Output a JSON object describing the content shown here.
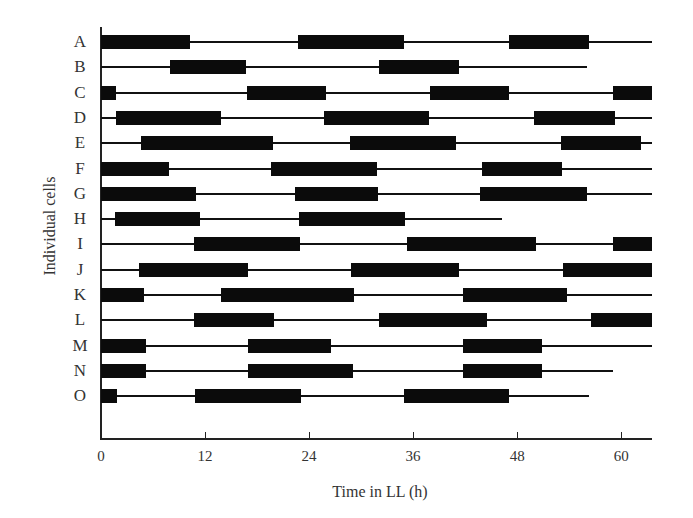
{
  "chart_data": {
    "type": "bar",
    "subtype": "horizontal-interval-timeline",
    "title": "",
    "xlabel": "Time in LL (h)",
    "ylabel": "Individual cells",
    "xlim": [
      0,
      63.6
    ],
    "xticks": [
      0,
      12,
      24,
      36,
      48,
      60
    ],
    "grid": false,
    "legend": null,
    "categories": [
      "A",
      "B",
      "C",
      "D",
      "E",
      "F",
      "G",
      "H",
      "I",
      "J",
      "K",
      "L",
      "M",
      "N",
      "O"
    ],
    "series": [
      {
        "name": "A",
        "trace": [
          0,
          63.6
        ],
        "active": [
          [
            0,
            10.3
          ],
          [
            22.7,
            35.0
          ],
          [
            47.1,
            56.3
          ]
        ]
      },
      {
        "name": "B",
        "trace": [
          0,
          56.1
        ],
        "active": [
          [
            8.0,
            16.7
          ],
          [
            32.1,
            41.3
          ]
        ]
      },
      {
        "name": "C",
        "trace": [
          0,
          63.6
        ],
        "active": [
          [
            0,
            1.7
          ],
          [
            16.8,
            26.0
          ],
          [
            38.0,
            47.1
          ],
          [
            59.1,
            63.6
          ]
        ]
      },
      {
        "name": "D",
        "trace": [
          0,
          63.6
        ],
        "active": [
          [
            1.7,
            13.8
          ],
          [
            25.7,
            37.8
          ],
          [
            49.9,
            59.3
          ]
        ]
      },
      {
        "name": "E",
        "trace": [
          0,
          63.6
        ],
        "active": [
          [
            4.6,
            19.8
          ],
          [
            28.7,
            41.0
          ],
          [
            53.0,
            62.3
          ]
        ]
      },
      {
        "name": "F",
        "trace": [
          0,
          63.6
        ],
        "active": [
          [
            0,
            7.8
          ],
          [
            19.6,
            31.8
          ],
          [
            43.9,
            53.2
          ]
        ]
      },
      {
        "name": "G",
        "trace": [
          0,
          63.6
        ],
        "active": [
          [
            0,
            11.0
          ],
          [
            22.4,
            32.0
          ],
          [
            43.7,
            56.1
          ]
        ]
      },
      {
        "name": "H",
        "trace": [
          0,
          46.2
        ],
        "active": [
          [
            1.6,
            11.4
          ],
          [
            22.8,
            35.1
          ]
        ]
      },
      {
        "name": "I",
        "trace": [
          0,
          63.6
        ],
        "active": [
          [
            10.7,
            23.0
          ],
          [
            35.3,
            50.2
          ],
          [
            59.1,
            63.6
          ]
        ]
      },
      {
        "name": "J",
        "trace": [
          0,
          63.6
        ],
        "active": [
          [
            4.4,
            16.9
          ],
          [
            28.8,
            41.3
          ],
          [
            53.3,
            63.6
          ]
        ]
      },
      {
        "name": "K",
        "trace": [
          0,
          63.6
        ],
        "active": [
          [
            0,
            5.0
          ],
          [
            13.8,
            29.2
          ],
          [
            41.8,
            53.8
          ]
        ]
      },
      {
        "name": "L",
        "trace": [
          0,
          63.6
        ],
        "active": [
          [
            10.7,
            19.9
          ],
          [
            32.1,
            44.5
          ],
          [
            56.5,
            63.6
          ]
        ]
      },
      {
        "name": "M",
        "trace": [
          0,
          63.6
        ],
        "active": [
          [
            0,
            5.2
          ],
          [
            16.9,
            26.5
          ],
          [
            41.8,
            50.9
          ]
        ]
      },
      {
        "name": "N",
        "trace": [
          0,
          59.1
        ],
        "active": [
          [
            0,
            5.2
          ],
          [
            16.9,
            29.1
          ],
          [
            41.8,
            50.9
          ]
        ]
      },
      {
        "name": "O",
        "trace": [
          0,
          56.3
        ],
        "active": [
          [
            0,
            1.8
          ],
          [
            10.8,
            23.1
          ],
          [
            35.0,
            47.1
          ]
        ]
      }
    ],
    "colors": {
      "bar": "#0b0b0b",
      "trace": "#111111",
      "axis": "#222222",
      "text": "#333333"
    }
  }
}
